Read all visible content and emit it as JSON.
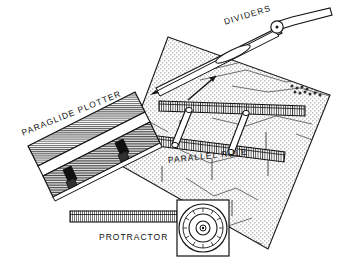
{
  "figure": {
    "background_color": "#ffffff",
    "ink_color": "#111111",
    "chart_fill": "#d8d8d8"
  },
  "labels": {
    "dividers": "DIVIDERS",
    "paraglide_plotter": "PARAGLIDE PLOTTER",
    "parallel_rule": "PARALLEL RULE",
    "protractor": "PROTRACTOR"
  },
  "instruments": [
    {
      "name": "dividers",
      "label": "DIVIDERS",
      "description": "Pair of drafting dividers with pivot joint at upper right and two tapered legs angled down-left",
      "pivot_x": 278,
      "pivot_y": 25
    },
    {
      "name": "paraglide-plotter",
      "label": "PARAGLIDE PLOTTER",
      "description": "Rectangular rolling plotter with fine horizontal hatching, graduated top edge and two dark roller clamps",
      "clamps": 2
    },
    {
      "name": "parallel-rule",
      "label": "PARALLEL RULE",
      "description": "Two graduated straightedges joined by two diagonal linkage arms",
      "bars": 2,
      "linkages": 2
    },
    {
      "name": "protractor",
      "label": "PROTRACTOR",
      "description": "Square-framed circular protractor with concentric graduated rings and a long graduated arm",
      "center_x": 203,
      "center_y": 228,
      "rings": 4
    },
    {
      "name": "chart",
      "label": "",
      "description": "Stippled nautical chart sheet rotated beneath the instruments, showing coastline and depth contour lines"
    }
  ],
  "chart_sheet": {
    "corners": "168,37 330,95 268,249 120,165",
    "texture": "stipple"
  }
}
